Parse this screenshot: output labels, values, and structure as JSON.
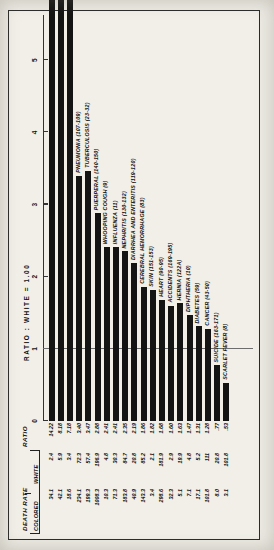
{
  "table": {
    "group_header": "DEATH RATE",
    "ratio_header": "RATIO",
    "sub_colored": "COLORED",
    "sub_white": "WHITE"
  },
  "axis": {
    "title": "RATIO : WHITE = 1.00",
    "ticks": [
      "0",
      "1",
      "2",
      "3",
      "4",
      "5"
    ],
    "min": 0,
    "max": 5.6,
    "reference_line": 1
  },
  "chart_data": {
    "type": "bar",
    "title": "RATIO : WHITE = 1.00",
    "xlabel": "RATIO : WHITE = 1.00",
    "ylabel": "",
    "xlim": [
      0,
      5.6
    ],
    "grid": false,
    "legend": "none",
    "orientation": "horizontal",
    "categories": [
      "PELLAGRA (88)",
      "SYPHILIS (34)",
      "HOMICIDE (172-175)",
      "PNEUMONIA (107-109)",
      "TUBERCULOSIS (23-32)",
      "PUERPERAL (140-150)",
      "WHOOPING COUGH (9)",
      "INFLUENZA (11)",
      "NEPHRITIS (130-132)",
      "DIARRHEA AND ENTERITIS (119-120)",
      "CEREBRAL HEMORRHAGE (83)",
      "SKIN (151-153)",
      "HEART (90-95)",
      "ACCIDENTS (169-195)",
      "HERNIA (122A)",
      "DIPHTHERIA (10)",
      "DIABETES (59)",
      "CANCER (43-50)",
      "SUICIDE (163-171)",
      "SCARLET FEVER (8)"
    ],
    "values": [
      14.22,
      8.18,
      7.18,
      3.4,
      3.47,
      2.88,
      2.41,
      2.41,
      2.35,
      2.19,
      1.86,
      1.82,
      1.68,
      1.6,
      1.63,
      1.47,
      1.31,
      1.28,
      0.77,
      0.53
    ],
    "death_rate_colored": [
      "34.1",
      "42.1",
      "18.6",
      "234.1",
      "199.3",
      "1008.3",
      "10.3",
      "71.3",
      "183.8",
      "40.9",
      "143.3",
      "3.4",
      "298.6",
      "32.3",
      "5.1",
      "7.1",
      "17.1",
      "101.8",
      "8.0",
      "3.1"
    ],
    "death_rate_white": [
      "2.4",
      "5.9",
      "3.4",
      "72.3",
      "57.4",
      "196.9",
      "4.8",
      "30.3",
      "84.7",
      "20.8",
      "85.2",
      "2.1",
      "181.9",
      "2.9",
      "19.9",
      "4.8",
      "5.2",
      "111",
      "20.8",
      "101.8"
    ],
    "ratio_labels": [
      "14.22",
      "8.18",
      "7.18",
      "3.40",
      "3.47",
      "2.88",
      "2.41",
      "2.41",
      "2.35",
      "2.19",
      "1.86",
      "1.82",
      "1.68",
      "1.60",
      "1.63",
      "1.47",
      "1.31",
      "1.28",
      ".77",
      ".53"
    ]
  }
}
